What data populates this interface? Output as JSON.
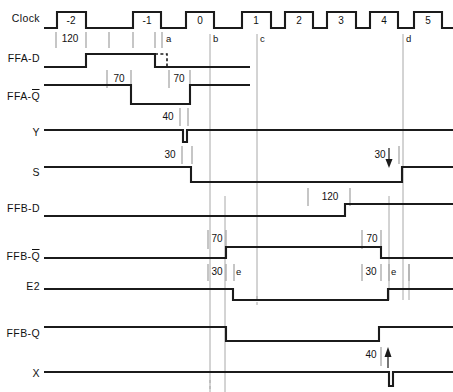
{
  "diagram": {
    "type": "timing-diagram",
    "width": 453,
    "height": 392,
    "colors": {
      "wave": "#1b1b1b",
      "grid": "#a8a8a8",
      "tick": "#8d8d8d",
      "background": "#ffffff"
    }
  },
  "signals": [
    {
      "id": "clock",
      "label": "Clock",
      "baseline_y": 28,
      "high_y": 12,
      "label_y": 22
    },
    {
      "id": "ffa_d",
      "label": "FFA-D",
      "baseline_y": 67,
      "high_y": 54,
      "label_y": 62
    },
    {
      "id": "ffa_qn",
      "label": "FFA-Q",
      "overline": true,
      "baseline_y": 95,
      "high_y": 85,
      "label_y": 100
    },
    {
      "id": "y",
      "label": "Y",
      "baseline_y": 130,
      "high_y": 130,
      "label_y": 136
    },
    {
      "id": "s",
      "label": "S",
      "baseline_y": 167,
      "high_y": 167,
      "label_y": 176
    },
    {
      "id": "ffb_d",
      "label": "FFB-D",
      "baseline_y": 216,
      "high_y": 204,
      "label_y": 212
    },
    {
      "id": "ffb_qn",
      "label": "FFB-Q",
      "overline": true,
      "baseline_y": 258,
      "high_y": 247,
      "label_y": 260
    },
    {
      "id": "e2",
      "label": "E2",
      "baseline_y": 289,
      "high_y": 278,
      "label_y": 290
    },
    {
      "id": "ffb_q",
      "label": "FFB-Q",
      "baseline_y": 338,
      "high_y": 327,
      "label_y": 337
    },
    {
      "id": "x",
      "label": "X",
      "baseline_y": 372,
      "high_y": 372,
      "label_y": 377
    }
  ],
  "clock": {
    "numbers": [
      "-2",
      "-1",
      "0",
      "1",
      "2",
      "3",
      "4",
      "5"
    ],
    "number_x": [
      71,
      147,
      200,
      256,
      299,
      341,
      384,
      428
    ],
    "edges": [
      {
        "rise": 57,
        "fall": 86
      },
      {
        "rise": 133,
        "fall": 161
      },
      {
        "rise": 186,
        "fall": 214
      },
      {
        "rise": 242,
        "fall": 271
      },
      {
        "rise": 285,
        "fall": 313
      },
      {
        "rise": 327,
        "fall": 356
      },
      {
        "rise": 370,
        "fall": 398
      },
      {
        "rise": 414,
        "fall": 442
      }
    ],
    "start_x": 44,
    "end_x": 453
  },
  "annotations": {
    "numbers": [
      {
        "id": "n-120-a",
        "text": "120",
        "x": 70,
        "y": 42
      },
      {
        "id": "n-a",
        "text": "a",
        "x": 169,
        "y": 42,
        "kind": "letter"
      },
      {
        "id": "n-b",
        "text": "b",
        "x": 214,
        "y": 42,
        "kind": "letter"
      },
      {
        "id": "n-c",
        "text": "c",
        "x": 259,
        "y": 42,
        "kind": "letter"
      },
      {
        "id": "n-d",
        "text": "d",
        "x": 405,
        "y": 42,
        "kind": "letter"
      },
      {
        "id": "n-70-1",
        "text": "70",
        "x": 116,
        "y": 80
      },
      {
        "id": "n-70-2",
        "text": "70",
        "x": 178,
        "y": 80
      },
      {
        "id": "n-40",
        "text": "40",
        "x": 169,
        "y": 118
      },
      {
        "id": "n-30-1",
        "text": "30",
        "x": 171,
        "y": 156
      },
      {
        "id": "n-30-2",
        "text": "30",
        "x": 377,
        "y": 156
      },
      {
        "id": "n-120-b",
        "text": "120",
        "x": 330,
        "y": 198
      },
      {
        "id": "n-70-3",
        "text": "70",
        "x": 216,
        "y": 240
      },
      {
        "id": "n-70-4",
        "text": "70",
        "x": 372,
        "y": 240
      },
      {
        "id": "n-30-3",
        "text": "30",
        "x": 216,
        "y": 273
      },
      {
        "id": "n-e-1",
        "text": "e",
        "x": 238,
        "y": 273,
        "kind": "letter"
      },
      {
        "id": "n-30-4",
        "text": "30",
        "x": 370,
        "y": 273
      },
      {
        "id": "n-e-2",
        "text": "e",
        "x": 392,
        "y": 273,
        "kind": "letter"
      },
      {
        "id": "n-40-2",
        "text": "40",
        "x": 371,
        "y": 356
      }
    ],
    "arrows": [
      {
        "id": "arrow-s-rise",
        "x": 389,
        "y1": 148,
        "y2": 166,
        "dir": "down"
      },
      {
        "id": "arrow-x-pulse",
        "x": 388,
        "y1": 368,
        "y2": 349,
        "dir": "up"
      }
    ]
  }
}
